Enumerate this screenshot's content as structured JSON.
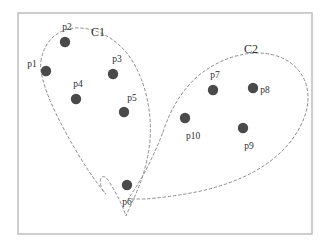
{
  "figure": {
    "kind": "cluster-scatter-diagram",
    "frame": {
      "x": 18,
      "y": 13,
      "width": 294,
      "height": 221
    },
    "canvas": {
      "width": 329,
      "height": 246
    },
    "colors": {
      "background": "#ffffff",
      "frame_border": "#b9b9b9",
      "point_fill": "#4a4a4a",
      "cluster_outline": "#8d8d8d",
      "label_text": "#2f2f2f"
    }
  },
  "points": [
    {
      "id": "p1",
      "label": "p1",
      "cx": 46,
      "cy": 71,
      "r": 5.2,
      "label_x": 32,
      "label_y": 65,
      "cluster": "C1"
    },
    {
      "id": "p2",
      "label": "p2",
      "cx": 65,
      "cy": 42,
      "r": 5.2,
      "label_x": 67,
      "label_y": 28,
      "cluster": "C1"
    },
    {
      "id": "p3",
      "label": "p3",
      "cx": 113,
      "cy": 74,
      "r": 5.2,
      "label_x": 117,
      "label_y": 60,
      "cluster": "C1"
    },
    {
      "id": "p4",
      "label": "p4",
      "cx": 76,
      "cy": 99,
      "r": 5.2,
      "label_x": 78,
      "label_y": 85,
      "cluster": "C1"
    },
    {
      "id": "p5",
      "label": "p5",
      "cx": 124,
      "cy": 112,
      "r": 5.2,
      "label_x": 132,
      "label_y": 99,
      "cluster": "C1"
    },
    {
      "id": "p6",
      "label": "p6",
      "cx": 127,
      "cy": 185,
      "r": 5.2,
      "label_x": 127,
      "label_y": 203,
      "cluster": "C1"
    },
    {
      "id": "p7",
      "label": "p7",
      "cx": 213,
      "cy": 90,
      "r": 5.2,
      "label_x": 215,
      "label_y": 76,
      "cluster": "C2"
    },
    {
      "id": "p8",
      "label": "p8",
      "cx": 253,
      "cy": 88,
      "r": 5.2,
      "label_x": 265,
      "label_y": 91,
      "cluster": "C2"
    },
    {
      "id": "p9",
      "label": "p9",
      "cx": 243,
      "cy": 128,
      "r": 5.2,
      "label_x": 249,
      "label_y": 147,
      "cluster": "C2"
    },
    {
      "id": "p10",
      "label": "p10",
      "cx": 185,
      "cy": 118,
      "r": 5.2,
      "label_x": 193,
      "label_y": 137,
      "cluster": "C2"
    }
  ],
  "clusters": [
    {
      "id": "C1",
      "label": "C1",
      "label_x": 98,
      "label_y": 33,
      "path": "M 41 61 C 44 41 58 29 75 28 C 97 27 120 40 133 62 C 146 84 152 112 150 140 C 148 163 141 183 134 198 C 131 205 128 211 126 216 C 124 210 121 203 118 197 C 113 188 110 183 108 180 C 106 177 104 176 102 177 C 100 178 100 182 101 186 C 102 190 104 193 106 194 C 99 186 88 171 78 154 C 62 127 48 100 43 80 C 41 73 40 66 41 61 Z"
    },
    {
      "id": "C2",
      "label": "C2",
      "label_x": 251,
      "label_y": 50,
      "path": "M 163 132 C 170 110 182 90 198 76 C 216 61 238 53 258 53 C 278 53 295 62 303 77 C 311 92 309 110 300 127 C 291 144 276 159 257 170 C 238 181 216 188 196 192 C 176 196 158 198 145 199 C 138 199 132 199 128 199 C 133 192 141 180 148 166 C 155 152 160 140 163 132 Z"
    }
  ]
}
